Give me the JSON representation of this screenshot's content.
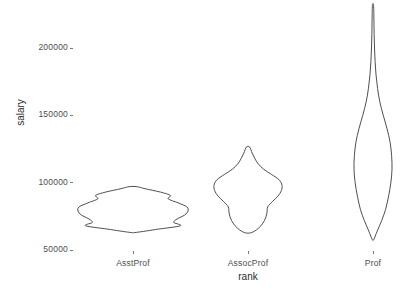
{
  "chart_data": {
    "type": "violin",
    "title": "",
    "xlabel": "rank",
    "ylabel": "salary",
    "grid": false,
    "legend": "none",
    "categories": [
      "AsstProf",
      "AssocProf",
      "Prof"
    ],
    "y_ticks": [
      50000,
      100000,
      150000,
      200000
    ],
    "y_tick_labels": [
      "50000",
      "100000",
      "150000",
      "200000"
    ],
    "ylim": [
      44000,
      240000
    ],
    "series": [
      {
        "name": "AsstProf",
        "min": 63100,
        "max": 97032,
        "median": 78500,
        "q1": 72500,
        "q3": 88500,
        "density_profile": [
          {
            "salary": 63100,
            "width": 0.06
          },
          {
            "salary": 65500,
            "width": 0.46
          },
          {
            "salary": 68000,
            "width": 0.86
          },
          {
            "salary": 70500,
            "width": 0.74
          },
          {
            "salary": 73000,
            "width": 0.8
          },
          {
            "salary": 76000,
            "width": 0.94
          },
          {
            "salary": 79000,
            "width": 1.0
          },
          {
            "salary": 82000,
            "width": 0.98
          },
          {
            "salary": 85000,
            "width": 0.82
          },
          {
            "salary": 88000,
            "width": 0.64
          },
          {
            "salary": 90500,
            "width": 0.68
          },
          {
            "salary": 93000,
            "width": 0.5
          },
          {
            "salary": 95500,
            "width": 0.22
          },
          {
            "salary": 97032,
            "width": 0.07
          }
        ]
      },
      {
        "name": "AssocProf",
        "min": 62884,
        "max": 126431,
        "median": 95626,
        "q1": 85000,
        "q3": 104500,
        "density_profile": [
          {
            "salary": 62884,
            "width": 0.1
          },
          {
            "salary": 66000,
            "width": 0.3
          },
          {
            "salary": 70000,
            "width": 0.44
          },
          {
            "salary": 74000,
            "width": 0.52
          },
          {
            "salary": 78000,
            "width": 0.56
          },
          {
            "salary": 82000,
            "width": 0.58
          },
          {
            "salary": 86000,
            "width": 0.72
          },
          {
            "salary": 90000,
            "width": 0.88
          },
          {
            "salary": 94000,
            "width": 0.98
          },
          {
            "salary": 98000,
            "width": 1.0
          },
          {
            "salary": 102000,
            "width": 0.92
          },
          {
            "salary": 106000,
            "width": 0.7
          },
          {
            "salary": 110000,
            "width": 0.46
          },
          {
            "salary": 114000,
            "width": 0.3
          },
          {
            "salary": 118000,
            "width": 0.2
          },
          {
            "salary": 122000,
            "width": 0.12
          },
          {
            "salary": 126431,
            "width": 0.05
          }
        ]
      },
      {
        "name": "Prof",
        "min": 57800,
        "max": 231545,
        "median": 123321,
        "q1": 106000,
        "q3": 143000,
        "density_profile": [
          {
            "salary": 57800,
            "width": 0.04
          },
          {
            "salary": 64000,
            "width": 0.22
          },
          {
            "salary": 72000,
            "width": 0.46
          },
          {
            "salary": 80000,
            "width": 0.66
          },
          {
            "salary": 90000,
            "width": 0.82
          },
          {
            "salary": 100000,
            "width": 0.94
          },
          {
            "salary": 110000,
            "width": 1.0
          },
          {
            "salary": 120000,
            "width": 0.98
          },
          {
            "salary": 130000,
            "width": 0.9
          },
          {
            "salary": 140000,
            "width": 0.74
          },
          {
            "salary": 150000,
            "width": 0.54
          },
          {
            "salary": 160000,
            "width": 0.36
          },
          {
            "salary": 170000,
            "width": 0.24
          },
          {
            "salary": 180000,
            "width": 0.16
          },
          {
            "salary": 190000,
            "width": 0.11
          },
          {
            "salary": 200000,
            "width": 0.08
          },
          {
            "salary": 210000,
            "width": 0.06
          },
          {
            "salary": 220000,
            "width": 0.05
          },
          {
            "salary": 231545,
            "width": 0.03
          }
        ]
      }
    ],
    "colors": {
      "stroke": "#3a3a3a",
      "background": "#ffffff",
      "tick_text": "#4d4d4d",
      "axis_title": "#2b2b2b"
    }
  }
}
